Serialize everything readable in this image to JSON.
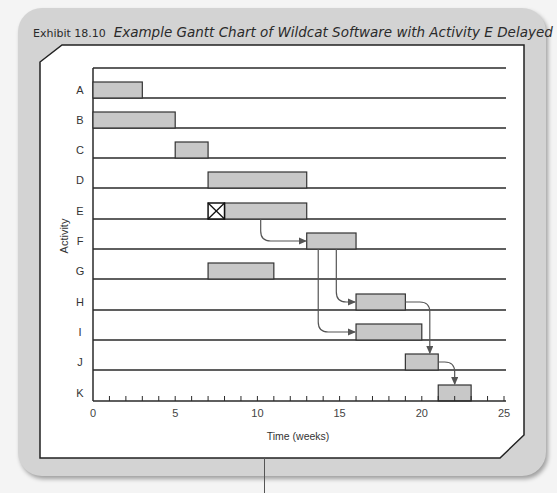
{
  "exhibit": {
    "label": "Exhibit 18.10",
    "title": "Example Gantt Chart of Wildcat Software with Activity E Delayed"
  },
  "colors": {
    "bar_fill": "#c8c8c8",
    "bar_stroke": "#333333",
    "grid_line": "#2a2a2a",
    "arrow": "#555555",
    "panel": "#ffffff",
    "card": "#d3d3d3"
  },
  "chart_data": {
    "type": "gantt",
    "title": "Example Gantt Chart of Wildcat Software with Activity E Delayed",
    "xlabel": "Time (weeks)",
    "ylabel": "Activity",
    "xlim": [
      0,
      25
    ],
    "x_ticks": [
      0,
      5,
      10,
      15,
      20,
      25
    ],
    "minor_tick_step": 1,
    "grid": "horizontal row lines",
    "categories": [
      "A",
      "B",
      "C",
      "D",
      "E",
      "F",
      "G",
      "H",
      "I",
      "J",
      "K"
    ],
    "tasks": [
      {
        "activity": "A",
        "start": 0,
        "end": 3
      },
      {
        "activity": "B",
        "start": 0,
        "end": 5
      },
      {
        "activity": "C",
        "start": 5,
        "end": 7
      },
      {
        "activity": "D",
        "start": 7,
        "end": 13
      },
      {
        "activity": "E",
        "start": 8,
        "end": 13,
        "delay": {
          "start": 7,
          "end": 8,
          "marker": "crossed-box"
        }
      },
      {
        "activity": "F",
        "start": 13,
        "end": 16
      },
      {
        "activity": "G",
        "start": 7,
        "end": 11
      },
      {
        "activity": "H",
        "start": 16,
        "end": 19
      },
      {
        "activity": "I",
        "start": 16,
        "end": 20
      },
      {
        "activity": "J",
        "start": 19,
        "end": 21
      },
      {
        "activity": "K",
        "start": 21,
        "end": 23
      }
    ],
    "dependencies": [
      {
        "from": "E",
        "to": "F"
      },
      {
        "from": "F",
        "to": "H"
      },
      {
        "from": "F",
        "to": "I"
      },
      {
        "from": "H",
        "to": "J"
      },
      {
        "from": "J",
        "to": "K"
      }
    ]
  }
}
